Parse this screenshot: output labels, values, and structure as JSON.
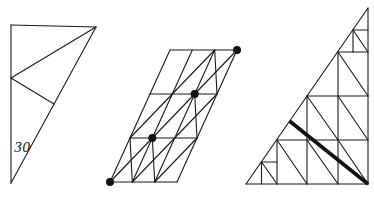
{
  "canvas": {
    "width": 374,
    "height": 198,
    "background": "#ffffff",
    "line_color": "#1a1a1a",
    "line_width": 1.1,
    "thick_line_width": 3.6,
    "dot_radius": 4
  },
  "figures": [
    {
      "id": "right-triangle-with-30-degree-angle",
      "segments": [
        [
          11,
          25,
          96,
          27
        ],
        [
          96,
          27,
          11,
          183
        ],
        [
          11,
          183,
          11,
          25
        ],
        [
          11,
          78,
          96,
          27
        ],
        [
          11,
          78,
          54,
          104
        ]
      ],
      "thick_segments": [],
      "dots": [],
      "labels": [
        {
          "text": "30",
          "x": 14,
          "y": 152,
          "font_size": 13,
          "style": "italic"
        }
      ]
    },
    {
      "id": "sheared-parallelogram-grid-with-diagonal-dots",
      "segments": [
        [
          110,
          182,
          177,
          182
        ],
        [
          177,
          182,
          237,
          50
        ],
        [
          237,
          50,
          170,
          50
        ],
        [
          170,
          50,
          110,
          182
        ],
        [
          132.3,
          182,
          192.3,
          50
        ],
        [
          154.7,
          182,
          214.7,
          50
        ],
        [
          130,
          138,
          197,
          138
        ],
        [
          150,
          94,
          217,
          94
        ],
        [
          110,
          182,
          237,
          50
        ],
        [
          132.3,
          182,
          174.7,
          138
        ],
        [
          154.7,
          182,
          197,
          138
        ],
        [
          130,
          138,
          172.3,
          94
        ],
        [
          174.7,
          138,
          217,
          94
        ],
        [
          172.3,
          94,
          214.7,
          50
        ],
        [
          130,
          138,
          132.3,
          182
        ],
        [
          152.3,
          138,
          154.7,
          182
        ],
        [
          194.7,
          94,
          197,
          138
        ],
        [
          214.7,
          50,
          217,
          94
        ]
      ],
      "thick_segments": [],
      "dots": [
        [
          110,
          182
        ],
        [
          152.3,
          138
        ],
        [
          194.7,
          94
        ],
        [
          237,
          50
        ]
      ],
      "labels": []
    },
    {
      "id": "subdivided-right-triangle-with-thick-altitude",
      "segments": [
        [
          246,
          184,
          368,
          184
        ],
        [
          368,
          184,
          368,
          8
        ],
        [
          368,
          8,
          246,
          184
        ],
        [
          277,
          140,
          277,
          184
        ],
        [
          307,
          96,
          307,
          184
        ],
        [
          338,
          52,
          338,
          184
        ],
        [
          261.5,
          162,
          261.5,
          184
        ],
        [
          353,
          30,
          353,
          52
        ],
        [
          277,
          140,
          368,
          140
        ],
        [
          307,
          96,
          368,
          96
        ],
        [
          338,
          52,
          368,
          52
        ],
        [
          261.5,
          162,
          277,
          162
        ],
        [
          353,
          30,
          368,
          30
        ],
        [
          261.5,
          162,
          277,
          184
        ],
        [
          277,
          140,
          307,
          184
        ],
        [
          307,
          140,
          338,
          184
        ],
        [
          338,
          140,
          368,
          184
        ],
        [
          307,
          96,
          338,
          140
        ],
        [
          338,
          96,
          368,
          140
        ],
        [
          338,
          52,
          368,
          96
        ],
        [
          353,
          30,
          368,
          52
        ]
      ],
      "thick_segments": [
        [
          289.5,
          121,
          368,
          184
        ]
      ],
      "dots": [],
      "labels": []
    }
  ]
}
